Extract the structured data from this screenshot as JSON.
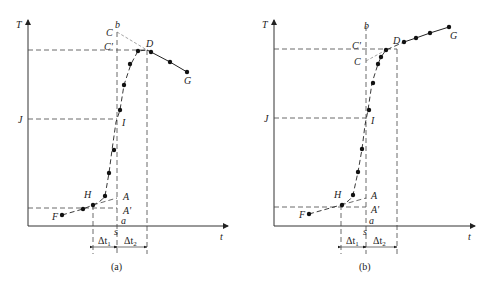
{
  "figure": {
    "panels": [
      {
        "id": "a",
        "caption": "(a)",
        "y_axis_label": "T",
        "x_axis_label": "t",
        "labels": {
          "C": "C",
          "C_prime": "C'",
          "b": "b",
          "D": "D",
          "G": "G",
          "J": "J",
          "I": "I",
          "H": "H",
          "A": "A",
          "A_prime": "A'",
          "F": "F",
          "a": "a",
          "s": "s"
        },
        "dt1": {
          "main": "Δt",
          "sub": "1"
        },
        "dt2": {
          "main": "Δt",
          "sub": "2"
        }
      },
      {
        "id": "b",
        "caption": "(b)",
        "y_axis_label": "T",
        "x_axis_label": "t",
        "labels": {
          "C": "C",
          "C_prime": "C'",
          "b": "b",
          "D": "D",
          "G": "G",
          "J": "J",
          "I": "I",
          "H": "H",
          "A": "A",
          "A_prime": "A'",
          "F": "F",
          "a": "a",
          "s": "s"
        },
        "dt1": {
          "main": "Δt",
          "sub": "1"
        },
        "dt2": {
          "main": "Δt",
          "sub": "2"
        }
      }
    ],
    "colors": {
      "ink": "#222222",
      "background": "#ffffff"
    }
  }
}
